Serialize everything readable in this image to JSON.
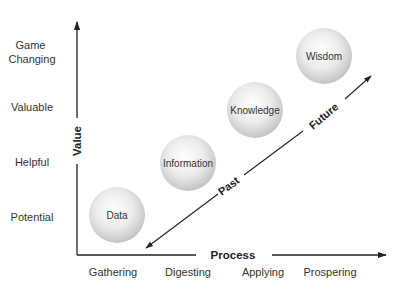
{
  "diagram": {
    "y_axis": {
      "title": "Value",
      "levels": [
        {
          "lines": [
            "Game",
            "Changing"
          ]
        },
        {
          "lines": [
            "Valuable"
          ]
        },
        {
          "lines": [
            "Helpful"
          ]
        },
        {
          "lines": [
            "Potential"
          ]
        }
      ]
    },
    "x_axis": {
      "title": "Process",
      "stages": [
        "Gathering",
        "Digesting",
        "Applying",
        "Prospering"
      ]
    },
    "nodes": [
      {
        "label": "Data",
        "stage": "Gathering",
        "value": "Potential"
      },
      {
        "label": "Information",
        "stage": "Digesting",
        "value": "Helpful"
      },
      {
        "label": "Knowledge",
        "stage": "Applying",
        "value": "Valuable"
      },
      {
        "label": "Wisdom",
        "stage": "Prospering",
        "value": "Game Changing"
      }
    ],
    "timeline": {
      "past_label": "Past",
      "future_label": "Future"
    },
    "colors": {
      "line": "#222222",
      "text": "#333333",
      "node_center": "#fafafa",
      "node_edge": "#c8c8c8"
    }
  }
}
